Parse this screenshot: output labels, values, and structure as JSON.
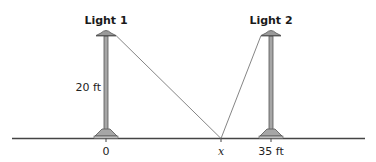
{
  "diagram": {
    "lights": [
      {
        "label": "Light 1",
        "position_label": "0",
        "height_label": "20 ft"
      },
      {
        "label": "Light 2",
        "position_label": "35 ft"
      }
    ],
    "point": {
      "label": "x"
    },
    "colors": {
      "pole": "#a6a6a6",
      "pole_outline": "#555555",
      "ground": "#444444",
      "rope": "#777777"
    }
  }
}
